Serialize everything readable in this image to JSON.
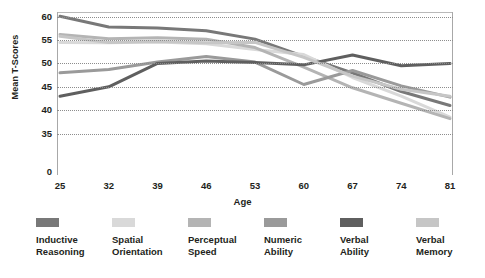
{
  "chart_data": {
    "type": "line",
    "title": "",
    "xlabel": "Age",
    "ylabel": "Mean T-Scores",
    "categories": [
      25,
      32,
      39,
      46,
      53,
      60,
      67,
      74,
      81
    ],
    "x": [
      25,
      32,
      39,
      46,
      53,
      60,
      67,
      74,
      81
    ],
    "xtick_labels": [
      "25",
      "32",
      "39",
      "46",
      "53",
      "60",
      "67",
      "74",
      "81"
    ],
    "ytick_labels": [
      "60",
      "55",
      "50",
      "45",
      "40",
      "35",
      "0"
    ],
    "ytick_values": [
      60,
      55,
      50,
      45,
      40,
      35,
      0
    ],
    "ylim": [
      30,
      61
    ],
    "xlim": [
      25,
      81
    ],
    "grid": "horizontal-dotted",
    "legend_position": "bottom",
    "series": [
      {
        "name": "Inductive Reasoning",
        "color": "#787878",
        "values": [
          60.1,
          57.8,
          57.6,
          57.0,
          55.2,
          51.5,
          48.0,
          44.0,
          41.0
        ]
      },
      {
        "name": "Spatial Orientation",
        "color": "#d9d9d9",
        "values": [
          54.5,
          54.4,
          54.6,
          54.2,
          53.0,
          51.9,
          47.0,
          43.0,
          38.5
        ]
      },
      {
        "name": "Perceptual Speed",
        "color": "#b4b4b4",
        "values": [
          56.2,
          55.3,
          55.5,
          55.2,
          53.4,
          49.2,
          44.8,
          41.5,
          38.2
        ]
      },
      {
        "name": "Numeric Ability",
        "color": "#9a9a9a",
        "values": [
          48.0,
          48.7,
          50.3,
          51.5,
          50.3,
          45.5,
          48.5,
          45.2,
          42.8
        ]
      },
      {
        "name": "Verbal Ability",
        "color": "#5f5f5f",
        "values": [
          43.0,
          45.0,
          50.0,
          50.5,
          50.2,
          49.7,
          51.8,
          49.5,
          50.0
        ]
      },
      {
        "name": "Verbal Memory",
        "color": "#c6c6c6",
        "values": [
          55.8,
          54.5,
          54.7,
          54.4,
          54.5,
          51.3,
          47.3,
          44.5,
          43.0
        ]
      }
    ]
  },
  "legend": {
    "items": [
      {
        "label": "Inductive\nReasoning",
        "color": "#787878"
      },
      {
        "label": "Spatial\nOrientation",
        "color": "#d9d9d9"
      },
      {
        "label": "Perceptual\nSpeed",
        "color": "#b4b4b4"
      },
      {
        "label": "Numeric\nAbility",
        "color": "#9a9a9a"
      },
      {
        "label": "Verbal\nAbility",
        "color": "#5f5f5f"
      },
      {
        "label": "Verbal\nMemory",
        "color": "#c6c6c6"
      }
    ]
  }
}
